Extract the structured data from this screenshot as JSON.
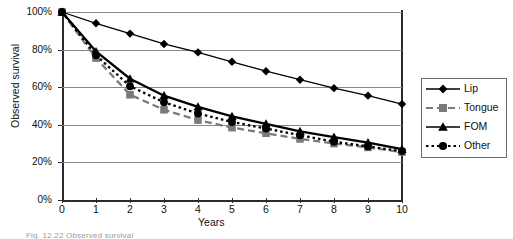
{
  "figure": {
    "caption": "Fig. 12.22   Observed survival",
    "background": "#ffffff"
  },
  "axes": {
    "y_label": "Observed survival",
    "x_label": "Years",
    "y_ticks": [
      "0%",
      "20%",
      "40%",
      "60%",
      "80%",
      "100%"
    ],
    "x_ticks": [
      "0",
      "1",
      "2",
      "3",
      "4",
      "5",
      "6",
      "7",
      "8",
      "9",
      "10"
    ]
  },
  "legend": {
    "items": [
      {
        "label": "Lip",
        "marker": "diamond-marker",
        "line": "solid",
        "color": "#000000"
      },
      {
        "label": "Tongue",
        "marker": "square-marker",
        "line": "dashed",
        "color": "#7a7a7a"
      },
      {
        "label": "FOM",
        "marker": "triangle-marker",
        "line": "solid",
        "color": "#000000"
      },
      {
        "label": "Other",
        "marker": "circle-marker",
        "line": "dotted",
        "color": "#000000"
      }
    ]
  },
  "chart_data": {
    "type": "line",
    "title": "",
    "xlabel": "Years",
    "ylabel": "Observed survival",
    "x": [
      0,
      1,
      2,
      3,
      4,
      5,
      6,
      7,
      8,
      9,
      10
    ],
    "xlim": [
      0,
      10
    ],
    "ylim": [
      0,
      100
    ],
    "y_tick_values": [
      0,
      20,
      40,
      60,
      80,
      100
    ],
    "grid": true,
    "legend_position": "right",
    "series": [
      {
        "name": "Lip",
        "marker": "diamond",
        "line": "solid",
        "color": "#000000",
        "values": [
          100,
          94,
          88.5,
          83,
          78.5,
          73.5,
          68.5,
          64,
          59.5,
          55.5,
          51
        ]
      },
      {
        "name": "Tongue",
        "marker": "square",
        "line": "dashed",
        "color": "#7a7a7a",
        "values": [
          100,
          75.5,
          56,
          48,
          42.5,
          38.5,
          35.5,
          32.5,
          30,
          28,
          25.5
        ]
      },
      {
        "name": "FOM",
        "marker": "triangle",
        "line": "solid",
        "color": "#000000",
        "values": [
          100,
          79,
          64.5,
          55.5,
          49.5,
          44.5,
          40.5,
          36.5,
          33.5,
          30.5,
          27
        ]
      },
      {
        "name": "Other",
        "marker": "circle",
        "line": "dotted",
        "color": "#000000",
        "values": [
          100,
          77,
          60.5,
          52,
          46,
          41.5,
          38,
          34.5,
          31,
          28.5,
          26
        ]
      }
    ]
  }
}
